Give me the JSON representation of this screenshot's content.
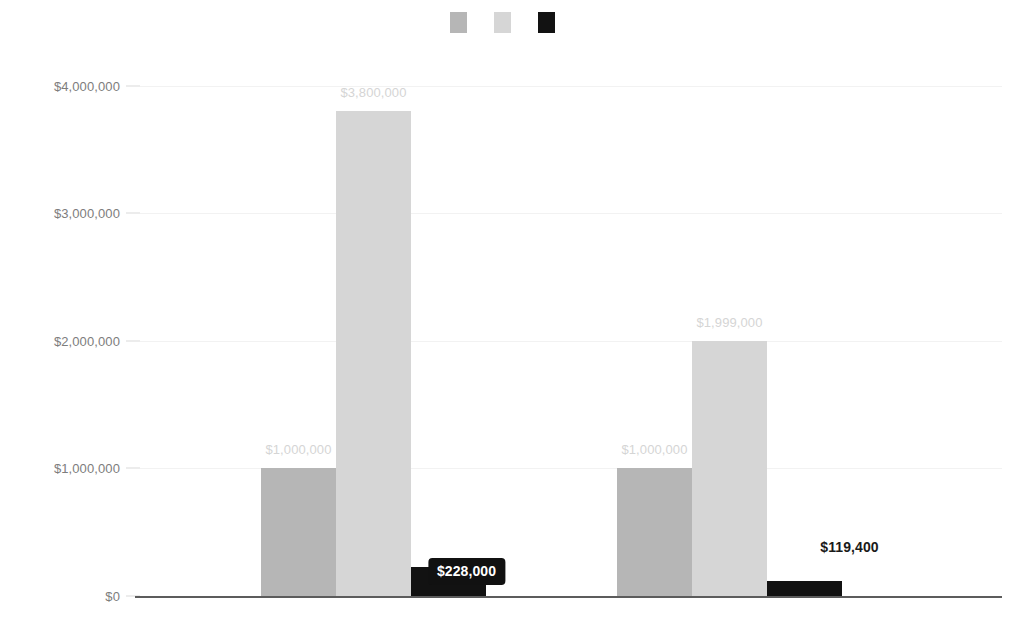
{
  "chart_data": {
    "type": "bar",
    "title": "",
    "subtitle": "",
    "xlabel": "",
    "ylabel": "",
    "ylim": [
      0,
      4200000
    ],
    "grid": true,
    "legend_position": "top-center",
    "y_ticks": [
      {
        "value": 0,
        "label": "$0"
      },
      {
        "value": 1000000,
        "label": "$1,000,000"
      },
      {
        "value": 2000000,
        "label": "$2,000,000"
      },
      {
        "value": 3000000,
        "label": "$3,000,000"
      },
      {
        "value": 4000000,
        "label": "$4,000,000"
      }
    ],
    "categories": [
      "",
      ""
    ],
    "series": [
      {
        "name": "",
        "color": "#b6b6b6",
        "label_style": "muted",
        "values": [
          1000000,
          1000000
        ],
        "value_labels": [
          "$1,000,000",
          "$1,000,000"
        ]
      },
      {
        "name": "",
        "color": "#d6d6d6",
        "label_style": "muted",
        "values": [
          3800000,
          1999000
        ],
        "value_labels": [
          "$3,800,000",
          "$1,999,000"
        ]
      },
      {
        "name": "",
        "color": "#121212",
        "label_style": "boxed",
        "values": [
          228000,
          119400
        ],
        "value_labels": [
          "$228,000",
          "$119,400"
        ]
      }
    ]
  },
  "legend": {
    "items": [
      {
        "swatch_color": "#b6b6b6",
        "label": ""
      },
      {
        "swatch_color": "#d6d6d6",
        "label": ""
      },
      {
        "swatch_color": "#121212",
        "label": ""
      }
    ]
  },
  "axis": {
    "baseline_color": "#5c5c5c",
    "gridline_color": "#f2f2f2",
    "tick_text_color": "#7d7d7d"
  }
}
